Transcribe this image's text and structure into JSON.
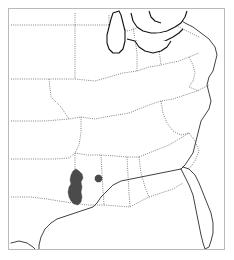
{
  "figure": {
    "type": "distribution-range-map",
    "region_name": "Central and Eastern United States",
    "background_color": "#ffffff",
    "frame_color": "#b9b9b9",
    "frame": {
      "x": 8,
      "y": 8,
      "width": 217,
      "height": 242
    }
  },
  "legend_colors": {
    "range_fill": "#4b4b4b",
    "state_border": "#6e6e6e",
    "coastline": "#2d2d2d",
    "lake_outline": "#111111",
    "land_fill": "#ffffff"
  },
  "map_data": {
    "projection_note": "unlabeled base map, no axes, no tick labels, no text",
    "state_boundary_style": "dotted",
    "coastline_style": "solid",
    "features": {
      "great_lakes": [
        "Lake Michigan",
        "Lake Erie",
        "Lake Huron"
      ],
      "coasts": [
        "Gulf of Mexico",
        "Atlantic Ocean"
      ],
      "peninsula": "Florida"
    },
    "range_patches": [
      {
        "name": "primary-range-louisiana",
        "approx_state": "Louisiana",
        "shape": "elongated north-south blob",
        "fill": "#4b4b4b"
      },
      {
        "name": "secondary-range-mississippi",
        "approx_state": "Mississippi",
        "shape": "small dot",
        "fill": "#4b4b4b"
      }
    ]
  },
  "geometry": {
    "state_borders": [
      "M 2 16 L 66 16",
      "M 66 4 L 66 16 L 66 70",
      "M 2 70 L 40 70 L 66 70",
      "M 66 16 L 100 16 L 104 20 L 112 18 L 118 22 L 126 20 L 132 16 L 146 16",
      "M 146 4 L 146 16 L 149 22 L 150 40 L 152 56",
      "M 66 70 L 86 72 L 100 68 L 114 64 L 128 62 L 140 58 L 152 56",
      "M 152 56 L 160 54 L 170 52 L 180 48 L 190 44",
      "M 2 112 L 36 112 L 60 110 L 72 108",
      "M 40 70 L 42 88 L 52 98 L 60 110",
      "M 72 108 L 86 110 L 96 108 L 108 106 L 120 104",
      "M 120 104 L 130 100 L 140 96 L 152 92 L 164 90 L 176 86 L 188 82 L 200 76",
      "M 72 108 L 72 124 L 70 136 L 66 144",
      "M 2 150 L 28 150 L 46 150 L 60 149 L 66 144",
      "M 66 144 L 78 146 L 92 146 L 106 147 L 118 148 L 130 148",
      "M 130 148 L 140 144 L 150 140 L 160 136 L 170 130 L 180 124",
      "M 66 144 L 66 164 L 66 182 L 64 194",
      "M 92 146 L 93 164 L 94 182 L 95 196",
      "M 118 148 L 119 166 L 120 184 L 121 198",
      "M 130 148 L 132 164 L 136 178 L 140 188",
      "M 2 188 L 22 188 L 38 190 L 50 192 L 64 194",
      "M 64 194 L 78 196 L 92 196 L 95 196",
      "M 95 196 L 108 197 L 121 198",
      "M 121 198 L 132 192 L 140 188",
      "M 140 188 L 152 184 L 164 180 L 174 174",
      "M 152 92 L 154 104 L 158 114 L 164 122 L 172 126 L 180 124",
      "M 180 124 L 186 132 L 190 142 L 186 152 L 180 160",
      "M 180 48 L 184 56 L 186 64 L 184 72 L 180 78 L 190 82",
      "M 146 16 L 156 14 L 166 16 L 174 20 L 182 24 L 190 28",
      "M 100 16 L 100 6",
      "M 128 62 L 128 44 L 126 30 L 124 18"
    ],
    "coastlines": [
      "M 168 4 L 170 10 L 176 14 L 184 18 L 192 24 L 200 30 L 206 38 L 208 46 L 206 54 L 204 62 L 200 68 L 198 76 L 200 84 L 202 92 L 200 100 L 196 106 L 192 112 L 190 120 L 188 128 L 186 136 L 184 144 L 180 150 L 176 156 L 172 160",
      "M 172 160 L 176 168 L 180 176 L 184 186 L 186 196 L 188 206 L 190 216 L 192 226 L 194 234 L 196 240 L 200 238 L 202 232 L 204 224 L 204 214 L 202 204 L 198 194 L 194 184 L 190 174 L 186 166 L 180 160 L 174 158",
      "M 172 160 L 162 162 L 152 164 L 142 166 L 132 168 L 122 170 L 112 172 L 104 176 L 98 182 L 92 188 L 88 194 L 84 198 L 78 200 L 72 202 L 66 204 L 60 206 L 54 208 L 48 210 L 42 214 L 36 220 L 32 228 L 30 236 L 30 242",
      "M 2 234 L 10 232 L 18 234 L 24 238 L 28 242"
    ],
    "lakes": [
      "M 104 4 L 102 10 L 100 18 L 98 26 L 98 34 L 100 40 L 104 44 L 110 44 L 114 40 L 116 32 L 116 22 L 114 14 L 112 6 L 110 2 Z",
      "M 122 4 L 124 12 L 128 18 L 134 22 L 142 24 L 150 24 L 158 22 L 166 18 L 172 14 L 176 8 L 178 2",
      "M 118 30 L 126 32 L 136 34 L 146 34 L 156 32 L 164 28 L 170 24 L 174 20",
      "M 126 32 L 130 38 L 136 42 L 144 44 L 152 42 L 158 38 L 162 32",
      "M 140 2 L 142 8 L 146 12 L 152 14"
    ],
    "range_primary": "M 64 162 L 62 166 L 61 171 L 62 175 L 60 178 L 59 183 L 60 188 L 62 192 L 65 195 L 69 196 L 72 193 L 73 188 L 72 183 L 73 178 L 72 173 L 74 169 L 73 165 L 70 162 L 67 160 Z",
    "range_secondary": "M 88 166 L 86 168 L 86 171 L 88 173 L 91 173 L 93 171 L 93 168 L 91 166 Z"
  }
}
